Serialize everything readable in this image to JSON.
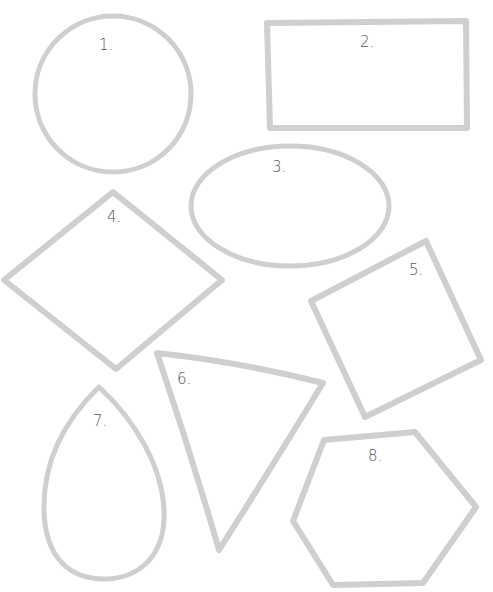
{
  "worksheet": {
    "stroke_color": "#cfcfcf",
    "label_color": "#555555",
    "background": "#ffffff",
    "shapes": [
      {
        "id": 1,
        "label": "1.",
        "kind": "circle"
      },
      {
        "id": 2,
        "label": "2.",
        "kind": "rectangle"
      },
      {
        "id": 3,
        "label": "3.",
        "kind": "oval"
      },
      {
        "id": 4,
        "label": "4.",
        "kind": "rhombus"
      },
      {
        "id": 5,
        "label": "5.",
        "kind": "square"
      },
      {
        "id": 6,
        "label": "6.",
        "kind": "triangle"
      },
      {
        "id": 7,
        "label": "7.",
        "kind": "teardrop"
      },
      {
        "id": 8,
        "label": "8.",
        "kind": "hexagon"
      }
    ]
  }
}
